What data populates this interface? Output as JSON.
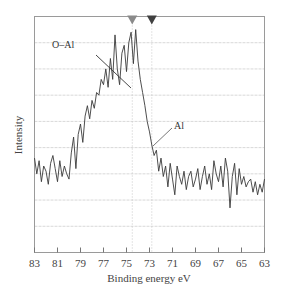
{
  "chart_data": {
    "type": "line",
    "title": "",
    "xlabel": "Binding energy eV",
    "ylabel": "Intensity",
    "xlim": [
      83,
      63
    ],
    "x_reversed": true,
    "xticks": [
      83,
      81,
      79,
      77,
      75,
      73,
      71,
      69,
      67,
      65,
      63
    ],
    "ylim": [
      0,
      9
    ],
    "yticks_labeled": false,
    "grid": {
      "horizontal": true,
      "vertical": false
    },
    "legend": null,
    "annotations": [
      {
        "text": "O–Al",
        "type": "label_with_line",
        "x": 76.8,
        "y": 7.3
      },
      {
        "text": "Al",
        "type": "label_with_line",
        "x": 73.0,
        "y": 4.1
      }
    ],
    "markers": [
      {
        "shape": "triangle-down",
        "x": 74.5,
        "color": "#8a8a8a",
        "dotted_line": true
      },
      {
        "shape": "triangle-down",
        "x": 72.8,
        "color": "#404040",
        "dotted_line": true
      }
    ],
    "series": [
      {
        "name": "XPS Al 2p spectrum",
        "color": "#3a3a3a",
        "x": [
          83.0,
          82.8,
          82.6,
          82.4,
          82.2,
          82.0,
          81.8,
          81.6,
          81.4,
          81.2,
          81.0,
          80.8,
          80.6,
          80.4,
          80.2,
          80.0,
          79.8,
          79.6,
          79.4,
          79.2,
          79.0,
          78.8,
          78.6,
          78.4,
          78.2,
          78.0,
          77.8,
          77.6,
          77.4,
          77.2,
          77.0,
          76.8,
          76.6,
          76.4,
          76.2,
          76.0,
          75.8,
          75.6,
          75.4,
          75.2,
          75.0,
          74.8,
          74.6,
          74.4,
          74.2,
          74.0,
          73.8,
          73.6,
          73.4,
          73.2,
          73.0,
          72.8,
          72.6,
          72.4,
          72.2,
          72.0,
          71.8,
          71.6,
          71.4,
          71.2,
          71.0,
          70.8,
          70.6,
          70.4,
          70.2,
          70.0,
          69.8,
          69.6,
          69.4,
          69.2,
          69.0,
          68.8,
          68.6,
          68.4,
          68.2,
          68.0,
          67.8,
          67.6,
          67.4,
          67.2,
          67.0,
          66.8,
          66.6,
          66.4,
          66.2,
          66.0,
          65.8,
          65.6,
          65.4,
          65.2,
          65.0,
          64.8,
          64.6,
          64.4,
          64.2,
          64.0,
          63.8,
          63.6,
          63.4,
          63.2,
          63.0
        ],
        "y": [
          3.6,
          3.0,
          3.5,
          2.7,
          3.3,
          3.1,
          2.6,
          3.4,
          3.7,
          3.2,
          2.7,
          3.5,
          2.9,
          3.3,
          3.0,
          2.8,
          3.8,
          4.4,
          3.2,
          4.5,
          4.9,
          4.2,
          5.2,
          5.6,
          5.1,
          5.8,
          5.5,
          6.1,
          6.0,
          6.6,
          6.4,
          7.0,
          6.3,
          7.4,
          6.6,
          8.3,
          7.0,
          6.4,
          7.6,
          7.9,
          6.9,
          8.0,
          8.4,
          7.2,
          8.5,
          7.3,
          6.6,
          6.1,
          5.6,
          5.0,
          4.6,
          4.1,
          3.7,
          3.9,
          3.1,
          3.6,
          2.9,
          3.3,
          2.5,
          3.4,
          2.8,
          2.2,
          3.3,
          2.9,
          2.6,
          3.1,
          2.4,
          2.9,
          3.1,
          2.5,
          2.8,
          3.2,
          2.4,
          2.9,
          3.3,
          2.6,
          3.0,
          2.4,
          3.5,
          3.0,
          2.7,
          3.3,
          2.5,
          3.6,
          3.1,
          1.7,
          2.9,
          3.4,
          2.2,
          3.2,
          2.6,
          2.9,
          2.5,
          2.7,
          2.8,
          2.3,
          2.7,
          2.2,
          2.6,
          2.3,
          2.8
        ]
      }
    ]
  }
}
